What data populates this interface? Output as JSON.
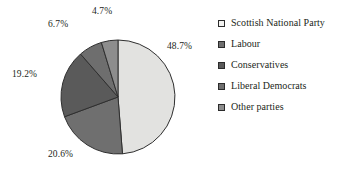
{
  "chart_data": {
    "type": "pie",
    "title": "",
    "categories": [
      "Scottish National Party",
      "Labour",
      "Conservatives",
      "Liberal Democrats",
      "Other parties"
    ],
    "values": [
      48.7,
      20.6,
      19.2,
      6.7,
      4.7
    ],
    "value_labels": [
      "48.7%",
      "20.6%",
      "19.2%",
      "6.7%",
      "4.7%"
    ],
    "unit": "%",
    "legend_position": "right",
    "grid": false,
    "start_angle_deg": 0,
    "direction": "clockwise",
    "colors": [
      "#e2e2e0",
      "#6f6f6f",
      "#5a5a5a",
      "#6e6e6e",
      "#8d8d8d"
    ],
    "stroke_color": "#2f2f2f"
  },
  "legend": {
    "items": [
      {
        "label": "Scottish National Party",
        "color": "#f2f2f0"
      },
      {
        "label": "Labour",
        "color": "#6f6f6f"
      },
      {
        "label": "Conservatives",
        "color": "#5a5a5a"
      },
      {
        "label": "Liberal Democrats",
        "color": "#6e6e6e"
      },
      {
        "label": "Other parties",
        "color": "#8d8d8d"
      }
    ]
  },
  "labels": {
    "snp": "48.7%",
    "labour": "20.6%",
    "conservatives": "19.2%",
    "liberal_democrats": "6.7%",
    "other_parties": "4.7%"
  }
}
